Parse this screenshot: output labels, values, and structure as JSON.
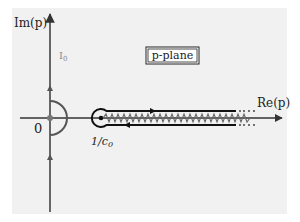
{
  "diagram": {
    "title": "p-plane",
    "axes": {
      "vertical_label": "Im(p)",
      "horizontal_label": "Re(p)"
    },
    "labels": {
      "origin": "0",
      "branch_point": "1/c",
      "branch_point_sub": "0",
      "contour_name": "I",
      "contour_name_sub": "0"
    },
    "colors": {
      "panel_background": "#f1f1f1",
      "axis": "#333333",
      "contour_axis": "#555555",
      "keyhole": "#111111",
      "branch_cut": "#666666",
      "origin_dot": "#777777",
      "gray_label": "#8a8a8a"
    }
  }
}
